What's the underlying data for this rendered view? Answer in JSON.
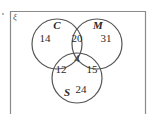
{
  "universal_set": {
    "symbol": "ξ"
  },
  "sets": [
    {
      "name": "C",
      "only": "14"
    },
    {
      "name": "M",
      "only": "31"
    },
    {
      "name": "S",
      "only": "24"
    }
  ],
  "intersections": {
    "C_M_only": "20",
    "C_S_only": "12",
    "M_S_only": "15",
    "C_M_S": "4"
  },
  "colors": {
    "stroke": "#555555",
    "frame": "#8a8a8a",
    "text": "#2a2a2a"
  }
}
